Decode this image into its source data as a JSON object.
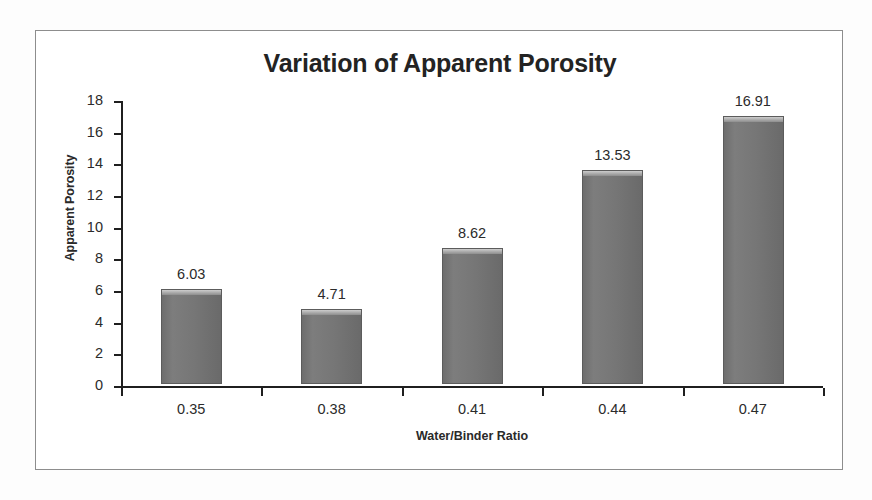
{
  "chart_data": {
    "type": "bar",
    "title": "Variation of Apparent Porosity",
    "xlabel": "Water/Binder Ratio",
    "ylabel": "Apparent Porosity",
    "categories": [
      "0.35",
      "0.38",
      "0.41",
      "0.44",
      "0.47"
    ],
    "values": [
      6.03,
      4.71,
      8.62,
      13.53,
      16.91
    ],
    "value_labels": [
      "6.03",
      "4.71",
      "8.62",
      "13.53",
      "16.91"
    ],
    "ylim": [
      0,
      18
    ],
    "ytick_labels": [
      "18",
      "16",
      "14",
      "12",
      "10",
      "8",
      "6",
      "4",
      "2",
      "0"
    ],
    "ytick_values": [
      18,
      16,
      14,
      12,
      10,
      8,
      6,
      4,
      2,
      0
    ],
    "grid": false,
    "legend": null,
    "legend_position": "none",
    "bar_color": "#767676",
    "axis_color": "#1f1f1f",
    "text_color": "#2b2b2b",
    "frame_color": "#8d8d8d",
    "background": "#ffffff"
  }
}
